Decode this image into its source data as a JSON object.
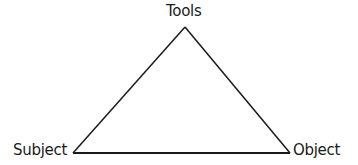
{
  "diagram": {
    "type": "triangle",
    "nodes": [
      {
        "id": "tools",
        "label": "Tools",
        "position": "top"
      },
      {
        "id": "subject",
        "label": "Subject",
        "position": "bottom-left"
      },
      {
        "id": "object",
        "label": "Object",
        "position": "bottom-right"
      }
    ],
    "edges": [
      {
        "from": "subject",
        "to": "tools"
      },
      {
        "from": "tools",
        "to": "object"
      },
      {
        "from": "subject",
        "to": "object"
      }
    ],
    "stroke_color": "#1a1a1a",
    "background": "#ffffff"
  }
}
